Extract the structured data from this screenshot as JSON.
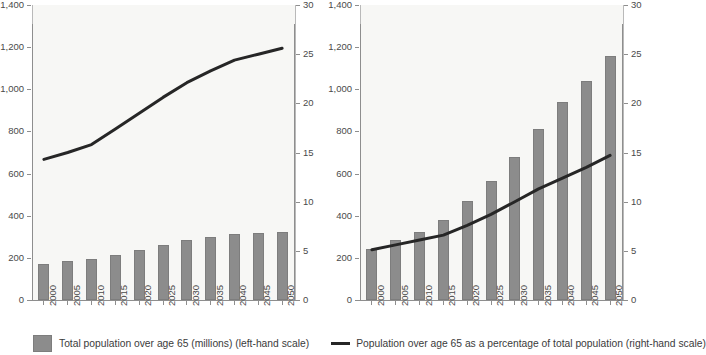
{
  "legend": {
    "bar_label": "Total population over age 65 (millions) (left-hand scale)",
    "line_label": "Population over age 65 as a percentage of total population (right-hand scale)",
    "bar_color": "#8c8c8c",
    "line_color": "#262626"
  },
  "chart_data": [
    {
      "type": "bar",
      "title": "A. Developed countries",
      "xlabel": "",
      "ylabel": "",
      "grid": false,
      "legend_position": "bottom",
      "categories": [
        "2000",
        "2005",
        "2010",
        "2015",
        "2020",
        "2025",
        "2030",
        "2035",
        "2040",
        "2045",
        "2050"
      ],
      "ylim": [
        0,
        1400
      ],
      "y_ticks": [
        0,
        200,
        400,
        600,
        800,
        1000,
        1200,
        1400
      ],
      "y_tick_labels": [
        "0",
        "200",
        "400",
        "600",
        "800",
        "1,000",
        "1,200",
        "1,400"
      ],
      "y2lim": [
        0,
        30
      ],
      "y2_ticks": [
        0,
        5,
        10,
        15,
        20,
        25,
        30
      ],
      "y2_tick_labels": [
        "0",
        "5",
        "10",
        "15",
        "20",
        "25",
        "30"
      ],
      "series": [
        {
          "name": "Total population over age 65 (millions) (left-hand scale)",
          "type": "bar",
          "axis": "left",
          "values": [
            170,
            183,
            196,
            215,
            237,
            263,
            285,
            299,
            312,
            318,
            325
          ]
        },
        {
          "name": "Population over age 65 as a percentage of total population (right-hand scale)",
          "type": "line",
          "axis": "right",
          "values": [
            14.3,
            15.0,
            15.8,
            17.4,
            19.0,
            20.6,
            22.1,
            23.3,
            24.4,
            25.0,
            25.6
          ]
        }
      ]
    },
    {
      "type": "bar",
      "title": "B. Developing countries",
      "xlabel": "",
      "ylabel": "",
      "grid": false,
      "legend_position": "bottom",
      "categories": [
        "2000",
        "2005",
        "2010",
        "2015",
        "2020",
        "2025",
        "2030",
        "2035",
        "2040",
        "2045",
        "2050"
      ],
      "ylim": [
        0,
        1400
      ],
      "y_ticks": [
        0,
        200,
        400,
        600,
        800,
        1000,
        1200,
        1400
      ],
      "y_tick_labels": [
        "0",
        "200",
        "400",
        "600",
        "800",
        "1,000",
        "1,200",
        "1,400"
      ],
      "y2lim": [
        0,
        30
      ],
      "y2_ticks": [
        0,
        5,
        10,
        15,
        20,
        25,
        30
      ],
      "y2_tick_labels": [
        "0",
        "5",
        "10",
        "15",
        "20",
        "25",
        "30"
      ],
      "series": [
        {
          "name": "Total population over age 65 (millions) (left-hand scale)",
          "type": "bar",
          "axis": "left",
          "values": [
            243,
            286,
            323,
            382,
            470,
            563,
            678,
            813,
            938,
            1037,
            1158
          ]
        },
        {
          "name": "Population over age 65 as a percentage of total population (right-hand scale)",
          "type": "line",
          "axis": "right",
          "values": [
            5.1,
            5.6,
            6.1,
            6.6,
            7.6,
            8.7,
            10.0,
            11.3,
            12.4,
            13.5,
            14.7
          ]
        }
      ]
    }
  ]
}
